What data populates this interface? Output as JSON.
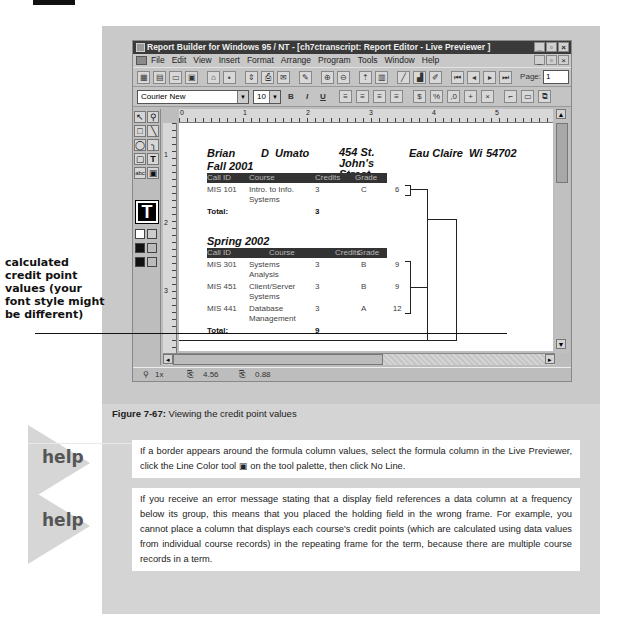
{
  "window": {
    "title": "Report Builder for Windows 95 / NT - [ch7ctranscript: Report Editor - Live Previewer ]",
    "title_buttons": [
      "_",
      "▫",
      "×"
    ],
    "menu": [
      "File",
      "Edit",
      "View",
      "Insert",
      "Format",
      "Arrange",
      "Program",
      "Tools",
      "Window",
      "Help"
    ],
    "page_label": "Page:",
    "page_value": "1",
    "font_name": "Courier New",
    "font_size": "10",
    "format_buttons": [
      "B",
      "I",
      "U"
    ]
  },
  "ruler": {
    "h_marks": [
      "0",
      "1",
      "2",
      "3",
      "4",
      "5"
    ],
    "v_marks": [
      "1",
      "2",
      "3"
    ]
  },
  "report": {
    "student": {
      "first": "Brian",
      "middle_last": "D  Umato",
      "street": "454 St. John's Street",
      "city": "Eau Claire",
      "state": "Wi",
      "zip": "54702"
    },
    "columns": [
      "Call ID",
      "Course",
      "Credits",
      "Grade"
    ],
    "terms": [
      {
        "name": "Fall 2001",
        "rows": [
          {
            "call_id": "MIS 101",
            "course": "Intro. to Info. Systems",
            "credits": "3",
            "grade": "C",
            "points": "6"
          }
        ],
        "total_label": "Total:",
        "total": "3"
      },
      {
        "name": "Spring 2002",
        "rows": [
          {
            "call_id": "MIS 301",
            "course": "Systems Analysis",
            "credits": "3",
            "grade": "B",
            "points": "9"
          },
          {
            "call_id": "MIS 451",
            "course": "Client/Server Systems",
            "credits": "3",
            "grade": "B",
            "points": "9"
          },
          {
            "call_id": "MIS 441",
            "course": "Database Management",
            "credits": "3",
            "grade": "A",
            "points": "12"
          }
        ],
        "total_label": "Total:",
        "total": "9"
      }
    ]
  },
  "status": {
    "zoom": "1x",
    "pos_x": "4.56",
    "pos_y": "0.88"
  },
  "callout": "calculated credit point values (your font style might be different)",
  "figure": {
    "label": "Figure 7-67:",
    "caption": " Viewing the credit point values"
  },
  "help": [
    {
      "tag": "help",
      "text": "If a border appears around the formula column values, select the formula column in the Live Previewer, click the Line Color tool ▣ on the tool palette, then click No Line."
    },
    {
      "tag": "help",
      "text": "If you receive an error message stating that a display field references a data column at a frequency below its group, this means that you placed the holding field in the wrong frame. For example, you cannot place a column that displays each course's credit points (which are calculated using data values from individual course records) in the repeating frame for the term, because there are multiple course records in a term."
    }
  ]
}
